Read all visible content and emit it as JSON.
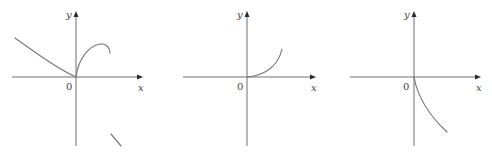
{
  "figure": {
    "panels": [
      {
        "id": "graph-1",
        "axes": {
          "y_label": "y",
          "x_label": "x",
          "origin_label": "0"
        },
        "description": "Curve decreasing from upper-left to origin, then a concave-down arc rising from origin and curving back; separate short line segment lower right"
      },
      {
        "id": "graph-2",
        "axes": {
          "y_label": "y",
          "x_label": "x",
          "origin_label": "0"
        },
        "description": "Concave-up curve starting at origin rising to the right"
      },
      {
        "id": "graph-3",
        "axes": {
          "y_label": "y",
          "x_label": "x",
          "origin_label": "0"
        },
        "description": "Curve starting at origin decreasing downward to the right"
      }
    ]
  },
  "colors": {
    "axis": "#6e6e6e",
    "curve": "#7a7a7a",
    "arrow": "#2a2a2a",
    "label": "#444444",
    "background": "#ffffff"
  }
}
